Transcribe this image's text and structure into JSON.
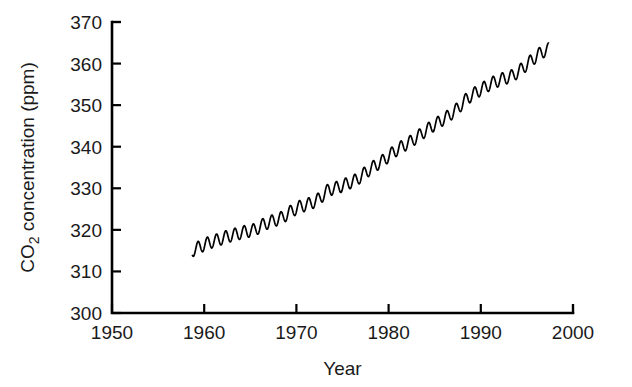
{
  "chart_data": {
    "type": "line",
    "title": "",
    "subtitle": "",
    "xlabel": "Year",
    "ylabel": "CO2 concentration (ppm)",
    "ylabel_parts": {
      "pre": "CO",
      "sub": "2",
      "post": " concentration (ppm)"
    },
    "xlim": [
      1950,
      2000
    ],
    "ylim": [
      300,
      370
    ],
    "xticks": [
      1950,
      1960,
      1970,
      1980,
      1990,
      2000
    ],
    "xtick_labels": [
      "1950",
      "1960",
      "1970",
      "1980",
      "1990",
      "2000"
    ],
    "yticks": [
      300,
      310,
      320,
      330,
      340,
      350,
      360,
      370
    ],
    "ytick_labels": [
      "300",
      "310",
      "320",
      "330",
      "340",
      "350",
      "360",
      "370"
    ],
    "grid": false,
    "legend": "none",
    "line_color": "#000000",
    "background_color": "#ffffff",
    "series": [
      {
        "name": "Mauna Loa CO2 monthly mean",
        "x_start": 1958.7,
        "x_end": 1997.4,
        "trend_description": "rising annual mean with seasonal sawtooth oscillation",
        "annual_means": [
          {
            "year": 1958.7,
            "value": 315.0
          },
          {
            "year": 1959.5,
            "value": 315.9
          },
          {
            "year": 1960.5,
            "value": 316.9
          },
          {
            "year": 1961.5,
            "value": 317.6
          },
          {
            "year": 1962.5,
            "value": 318.4
          },
          {
            "year": 1963.5,
            "value": 319.0
          },
          {
            "year": 1964.5,
            "value": 319.6
          },
          {
            "year": 1965.5,
            "value": 320.0
          },
          {
            "year": 1966.5,
            "value": 321.4
          },
          {
            "year": 1967.5,
            "value": 322.2
          },
          {
            "year": 1968.5,
            "value": 323.0
          },
          {
            "year": 1969.5,
            "value": 324.6
          },
          {
            "year": 1970.5,
            "value": 325.7
          },
          {
            "year": 1971.5,
            "value": 326.3
          },
          {
            "year": 1972.5,
            "value": 327.5
          },
          {
            "year": 1973.5,
            "value": 329.7
          },
          {
            "year": 1974.5,
            "value": 330.2
          },
          {
            "year": 1975.5,
            "value": 331.1
          },
          {
            "year": 1976.5,
            "value": 332.0
          },
          {
            "year": 1977.5,
            "value": 333.8
          },
          {
            "year": 1978.5,
            "value": 335.4
          },
          {
            "year": 1979.5,
            "value": 336.8
          },
          {
            "year": 1980.5,
            "value": 338.7
          },
          {
            "year": 1981.5,
            "value": 340.1
          },
          {
            "year": 1982.5,
            "value": 341.4
          },
          {
            "year": 1983.5,
            "value": 343.0
          },
          {
            "year": 1984.5,
            "value": 344.6
          },
          {
            "year": 1985.5,
            "value": 346.0
          },
          {
            "year": 1986.5,
            "value": 347.4
          },
          {
            "year": 1987.5,
            "value": 349.2
          },
          {
            "year": 1988.5,
            "value": 351.6
          },
          {
            "year": 1989.5,
            "value": 353.1
          },
          {
            "year": 1990.5,
            "value": 354.4
          },
          {
            "year": 1991.5,
            "value": 355.6
          },
          {
            "year": 1992.5,
            "value": 356.4
          },
          {
            "year": 1993.5,
            "value": 357.1
          },
          {
            "year": 1994.5,
            "value": 358.8
          },
          {
            "year": 1995.5,
            "value": 360.8
          },
          {
            "year": 1996.5,
            "value": 362.6
          },
          {
            "year": 1997.4,
            "value": 363.5
          }
        ],
        "seasonal_amplitude_ppm": 3.0,
        "seasonal_peak_month": 5,
        "min_value": 313.0,
        "max_value": 365.0
      }
    ]
  }
}
